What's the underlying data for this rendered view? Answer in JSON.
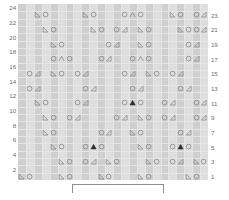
{
  "chart": {
    "rows_total": 24,
    "cols_total": 24,
    "row_labels_left": [
      "24",
      "22",
      "20",
      "18",
      "16",
      "14",
      "12",
      "10",
      "8",
      "6",
      "4",
      "2"
    ],
    "row_labels_right": [
      "23",
      "21",
      "19",
      "17",
      "15",
      "13",
      "11",
      "9",
      "7",
      "5",
      "3",
      "1"
    ],
    "repeat_bracket_label": "",
    "colors": {
      "grid_base": "#d9d9d9",
      "stripe_dark": "#cfcfcf",
      "stripe_light": "#dedede",
      "gridline": "#e8e8e8",
      "symbol": "#8a8a8a",
      "symbol_filled": "#2b2b2b",
      "label_text": "#6e6e6e",
      "bracket": "#8f8f8f",
      "background": "#ffffff"
    }
  },
  "legend": {
    "symbols": [
      {
        "key": "ssk",
        "name": "left-leaning-decrease-icon",
        "glyph": "◣",
        "description": "ssk / left-leaning decrease"
      },
      {
        "key": "yo",
        "name": "yarn-over-icon",
        "glyph": "○",
        "description": "yarn over"
      },
      {
        "key": "k2tog",
        "name": "right-leaning-decrease-icon",
        "glyph": "◿",
        "description": "k2tog / right-leaning decrease"
      },
      {
        "key": "cdd",
        "name": "central-double-decrease-icon",
        "glyph": "Λ",
        "description": "central double decrease"
      },
      {
        "key": "cddf",
        "name": "filled-central-decrease-icon",
        "glyph": "▲",
        "description": "filled central double decrease"
      }
    ]
  },
  "chart_data": {
    "type": "table",
    "xlabel": "stitch",
    "ylabel": "row",
    "grid": true,
    "cols": 24,
    "rows": 24,
    "legend_position": "none",
    "note": "Symbols are placed on odd-numbered rows only; even rows are plain.",
    "rows_data": [
      {
        "row": 24,
        "side": "left",
        "cells": []
      },
      {
        "row": 23,
        "side": "right",
        "cells": [
          {
            "col": 3,
            "sym": "ssk"
          },
          {
            "col": 4,
            "sym": "yo"
          },
          {
            "col": 9,
            "sym": "ssk"
          },
          {
            "col": 10,
            "sym": "yo"
          },
          {
            "col": 14,
            "sym": "yo"
          },
          {
            "col": 15,
            "sym": "cdd"
          },
          {
            "col": 16,
            "sym": "yo"
          },
          {
            "col": 20,
            "sym": "ssk"
          },
          {
            "col": 21,
            "sym": "yo"
          },
          {
            "col": 23,
            "sym": "yo"
          },
          {
            "col": 24,
            "sym": "k2tog"
          }
        ]
      },
      {
        "row": 22,
        "side": "left",
        "cells": []
      },
      {
        "row": 21,
        "side": "right",
        "cells": [
          {
            "col": 4,
            "sym": "ssk"
          },
          {
            "col": 5,
            "sym": "yo"
          },
          {
            "col": 10,
            "sym": "ssk"
          },
          {
            "col": 11,
            "sym": "yo"
          },
          {
            "col": 13,
            "sym": "yo"
          },
          {
            "col": 14,
            "sym": "k2tog"
          },
          {
            "col": 16,
            "sym": "ssk"
          },
          {
            "col": 17,
            "sym": "yo"
          },
          {
            "col": 21,
            "sym": "ssk"
          },
          {
            "col": 22,
            "sym": "yo"
          },
          {
            "col": 23,
            "sym": "yo"
          },
          {
            "col": 24,
            "sym": "k2tog"
          }
        ]
      },
      {
        "row": 20,
        "side": "left",
        "cells": []
      },
      {
        "row": 19,
        "side": "right",
        "cells": [
          {
            "col": 5,
            "sym": "ssk"
          },
          {
            "col": 6,
            "sym": "yo"
          },
          {
            "col": 12,
            "sym": "yo"
          },
          {
            "col": 13,
            "sym": "k2tog"
          },
          {
            "col": 16,
            "sym": "ssk"
          },
          {
            "col": 17,
            "sym": "yo"
          },
          {
            "col": 22,
            "sym": "yo"
          },
          {
            "col": 23,
            "sym": "k2tog"
          }
        ]
      },
      {
        "row": 18,
        "side": "left",
        "cells": []
      },
      {
        "row": 17,
        "side": "right",
        "cells": [
          {
            "col": 5,
            "sym": "yo"
          },
          {
            "col": 6,
            "sym": "cdd"
          },
          {
            "col": 7,
            "sym": "yo"
          },
          {
            "col": 11,
            "sym": "yo"
          },
          {
            "col": 12,
            "sym": "k2tog"
          },
          {
            "col": 15,
            "sym": "yo"
          },
          {
            "col": 16,
            "sym": "cdd"
          },
          {
            "col": 17,
            "sym": "yo"
          },
          {
            "col": 22,
            "sym": "yo"
          },
          {
            "col": 23,
            "sym": "k2tog"
          }
        ]
      },
      {
        "row": 16,
        "side": "left",
        "cells": []
      },
      {
        "row": 15,
        "side": "right",
        "cells": [
          {
            "col": 2,
            "sym": "yo"
          },
          {
            "col": 3,
            "sym": "k2tog"
          },
          {
            "col": 5,
            "sym": "ssk"
          },
          {
            "col": 6,
            "sym": "yo"
          },
          {
            "col": 8,
            "sym": "yo"
          },
          {
            "col": 9,
            "sym": "k2tog"
          },
          {
            "col": 14,
            "sym": "yo"
          },
          {
            "col": 15,
            "sym": "k2tog"
          },
          {
            "col": 17,
            "sym": "ssk"
          },
          {
            "col": 18,
            "sym": "yo"
          },
          {
            "col": 20,
            "sym": "yo"
          },
          {
            "col": 21,
            "sym": "k2tog"
          }
        ]
      },
      {
        "row": 14,
        "side": "left",
        "cells": []
      },
      {
        "row": 13,
        "side": "right",
        "cells": [
          {
            "col": 2,
            "sym": "yo"
          },
          {
            "col": 3,
            "sym": "k2tog"
          },
          {
            "col": 9,
            "sym": "yo"
          },
          {
            "col": 10,
            "sym": "k2tog"
          },
          {
            "col": 15,
            "sym": "yo"
          },
          {
            "col": 16,
            "sym": "k2tog"
          },
          {
            "col": 21,
            "sym": "yo"
          },
          {
            "col": 22,
            "sym": "k2tog"
          }
        ]
      },
      {
        "row": 12,
        "side": "left",
        "cells": []
      },
      {
        "row": 11,
        "side": "right",
        "cells": [
          {
            "col": 3,
            "sym": "ssk"
          },
          {
            "col": 4,
            "sym": "yo"
          },
          {
            "col": 8,
            "sym": "yo"
          },
          {
            "col": 9,
            "sym": "k2tog"
          },
          {
            "col": 14,
            "sym": "yo"
          },
          {
            "col": 15,
            "sym": "cddf"
          },
          {
            "col": 16,
            "sym": "yo"
          },
          {
            "col": 19,
            "sym": "yo"
          },
          {
            "col": 20,
            "sym": "k2tog"
          },
          {
            "col": 23,
            "sym": "yo"
          },
          {
            "col": 24,
            "sym": "k2tog"
          }
        ]
      },
      {
        "row": 10,
        "side": "left",
        "cells": []
      },
      {
        "row": 9,
        "side": "right",
        "cells": [
          {
            "col": 4,
            "sym": "ssk"
          },
          {
            "col": 5,
            "sym": "yo"
          },
          {
            "col": 7,
            "sym": "yo"
          },
          {
            "col": 8,
            "sym": "k2tog"
          },
          {
            "col": 13,
            "sym": "yo"
          },
          {
            "col": 14,
            "sym": "k2tog"
          },
          {
            "col": 16,
            "sym": "ssk"
          },
          {
            "col": 17,
            "sym": "yo"
          },
          {
            "col": 19,
            "sym": "yo"
          },
          {
            "col": 20,
            "sym": "k2tog"
          },
          {
            "col": 23,
            "sym": "yo"
          },
          {
            "col": 24,
            "sym": "k2tog"
          }
        ]
      },
      {
        "row": 8,
        "side": "left",
        "cells": []
      },
      {
        "row": 7,
        "side": "right",
        "cells": [
          {
            "col": 4,
            "sym": "ssk"
          },
          {
            "col": 5,
            "sym": "yo"
          },
          {
            "col": 11,
            "sym": "yo"
          },
          {
            "col": 12,
            "sym": "k2tog"
          },
          {
            "col": 15,
            "sym": "ssk"
          },
          {
            "col": 16,
            "sym": "yo"
          },
          {
            "col": 21,
            "sym": "yo"
          },
          {
            "col": 22,
            "sym": "k2tog"
          }
        ]
      },
      {
        "row": 6,
        "side": "left",
        "cells": []
      },
      {
        "row": 5,
        "side": "right",
        "cells": [
          {
            "col": 5,
            "sym": "ssk"
          },
          {
            "col": 6,
            "sym": "yo"
          },
          {
            "col": 9,
            "sym": "yo"
          },
          {
            "col": 10,
            "sym": "cddf"
          },
          {
            "col": 11,
            "sym": "yo"
          },
          {
            "col": 16,
            "sym": "ssk"
          },
          {
            "col": 17,
            "sym": "yo"
          },
          {
            "col": 20,
            "sym": "yo"
          },
          {
            "col": 21,
            "sym": "cddf"
          },
          {
            "col": 22,
            "sym": "yo"
          }
        ]
      },
      {
        "row": 4,
        "side": "left",
        "cells": []
      },
      {
        "row": 3,
        "side": "right",
        "cells": [
          {
            "col": 6,
            "sym": "ssk"
          },
          {
            "col": 7,
            "sym": "yo"
          },
          {
            "col": 9,
            "sym": "yo"
          },
          {
            "col": 10,
            "sym": "k2tog"
          },
          {
            "col": 12,
            "sym": "ssk"
          },
          {
            "col": 13,
            "sym": "yo"
          },
          {
            "col": 17,
            "sym": "ssk"
          },
          {
            "col": 18,
            "sym": "yo"
          },
          {
            "col": 20,
            "sym": "yo"
          },
          {
            "col": 21,
            "sym": "k2tog"
          },
          {
            "col": 23,
            "sym": "ssk"
          },
          {
            "col": 24,
            "sym": "yo"
          }
        ]
      },
      {
        "row": 2,
        "side": "left",
        "cells": []
      },
      {
        "row": 1,
        "side": "right",
        "cells": [
          {
            "col": 1,
            "sym": "ssk"
          },
          {
            "col": 2,
            "sym": "yo"
          },
          {
            "col": 6,
            "sym": "ssk"
          },
          {
            "col": 7,
            "sym": "yo"
          },
          {
            "col": 11,
            "sym": "ssk"
          },
          {
            "col": 12,
            "sym": "yo"
          },
          {
            "col": 16,
            "sym": "ssk"
          },
          {
            "col": 17,
            "sym": "yo"
          },
          {
            "col": 22,
            "sym": "ssk"
          },
          {
            "col": 23,
            "sym": "yo"
          }
        ]
      }
    ]
  }
}
